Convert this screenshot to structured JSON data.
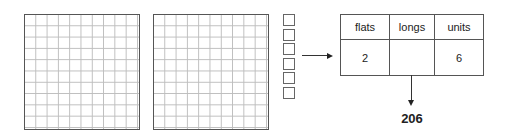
{
  "diagram": {
    "blocks": {
      "flats": {
        "count": 2,
        "grid_size": "10x10"
      },
      "longs": {
        "count": 0
      },
      "units": {
        "count": 6
      }
    },
    "place_value_table": {
      "headers": [
        "flats",
        "longs",
        "units"
      ],
      "values": [
        "2",
        "",
        "6"
      ]
    },
    "result": "206",
    "colors": {
      "border": "#555555",
      "gridline": "#bdbdbd",
      "text": "#222222"
    }
  }
}
